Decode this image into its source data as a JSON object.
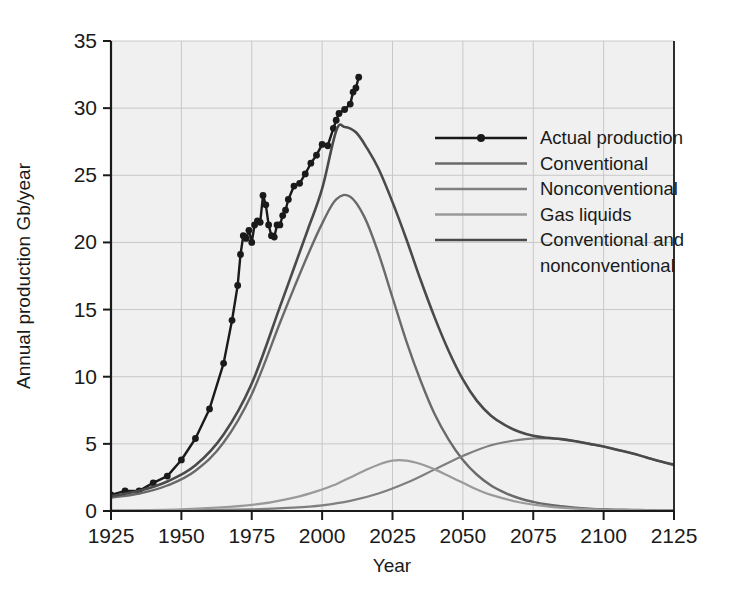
{
  "chart_data": {
    "type": "line",
    "title": "",
    "xlabel": "Year",
    "ylabel": "Annual production Gb/year",
    "xlim": [
      1925,
      2125
    ],
    "ylim": [
      0,
      35
    ],
    "xticks": [
      1925,
      1950,
      1975,
      2000,
      2025,
      2050,
      2075,
      2100,
      2125
    ],
    "yticks": [
      0,
      5,
      10,
      15,
      20,
      25,
      30,
      35
    ],
    "xtick_labels": [
      "1925",
      "1950",
      "1975",
      "2000",
      "2025",
      "2050",
      "2075",
      "2100",
      "2125"
    ],
    "ytick_labels": [
      "0",
      "5",
      "10",
      "15",
      "20",
      "25",
      "30",
      "35"
    ],
    "grid": true,
    "legend_position": "upper right",
    "plot_background": "#f0f0f0",
    "series": [
      {
        "name": "Actual production",
        "color": "#1a1a1a",
        "markers": true,
        "width": 2.4,
        "x": [
          1925,
          1930,
          1935,
          1940,
          1945,
          1950,
          1955,
          1960,
          1965,
          1968,
          1970,
          1971,
          1972,
          1973,
          1974,
          1975,
          1976,
          1977,
          1978,
          1979,
          1980,
          1981,
          1982,
          1983,
          1984,
          1985,
          1986,
          1987,
          1988,
          1990,
          1992,
          1994,
          1996,
          1998,
          2000,
          2002,
          2004,
          2005,
          2006,
          2008,
          2010,
          2011,
          2012,
          2013
        ],
        "y": [
          1.2,
          1.5,
          1.5,
          2.1,
          2.6,
          3.8,
          5.4,
          7.6,
          11.0,
          14.2,
          16.8,
          19.1,
          20.5,
          20.3,
          20.9,
          20.0,
          21.3,
          21.6,
          21.5,
          23.5,
          22.8,
          21.3,
          20.5,
          20.4,
          21.3,
          21.3,
          22.0,
          22.4,
          23.2,
          24.2,
          24.4,
          25.1,
          25.9,
          26.5,
          27.3,
          27.2,
          28.5,
          29.1,
          29.6,
          29.9,
          30.3,
          31.2,
          31.5,
          32.3
        ]
      },
      {
        "name": "Conventional",
        "color": "#6a6a6a",
        "markers": false,
        "width": 2.4,
        "peak_year": 2005,
        "peak_value": 23.5,
        "x": [
          1925,
          1935,
          1945,
          1955,
          1965,
          1975,
          1985,
          1990,
          1995,
          2000,
          2005,
          2010,
          2015,
          2020,
          2025,
          2030,
          2035,
          2040,
          2045,
          2050,
          2055,
          2060,
          2065,
          2070,
          2075,
          2080,
          2085,
          2090,
          2095,
          2100,
          2105,
          2110,
          2115,
          2120,
          2125
        ],
        "y": [
          1.0,
          1.3,
          1.9,
          3.0,
          5.1,
          8.7,
          14.0,
          16.6,
          19.1,
          21.4,
          23.2,
          23.4,
          21.9,
          19.2,
          15.9,
          12.6,
          9.7,
          7.2,
          5.3,
          3.8,
          2.7,
          1.9,
          1.35,
          0.95,
          0.68,
          0.48,
          0.35,
          0.25,
          0.18,
          0.13,
          0.1,
          0.08,
          0.06,
          0.05,
          0.04
        ]
      },
      {
        "name": "Nonconventional",
        "color": "#7f7f7f",
        "markers": false,
        "width": 2.2,
        "peak_year": 2078,
        "peak_value": 5.4,
        "x": [
          1925,
          1950,
          1975,
          1990,
          2000,
          2010,
          2020,
          2030,
          2040,
          2050,
          2060,
          2070,
          2075,
          2080,
          2085,
          2090,
          2095,
          2100,
          2110,
          2120,
          2125
        ],
        "y": [
          0.02,
          0.05,
          0.12,
          0.25,
          0.42,
          0.75,
          1.3,
          2.1,
          3.1,
          4.1,
          4.9,
          5.3,
          5.4,
          5.4,
          5.35,
          5.2,
          5.0,
          4.8,
          4.3,
          3.7,
          3.4
        ]
      },
      {
        "name": "Gas liquids",
        "color": "#9a9a9a",
        "markers": false,
        "width": 2.2,
        "peak_year": 2026,
        "peak_value": 3.8,
        "x": [
          1925,
          1950,
          1975,
          1990,
          2000,
          2005,
          2010,
          2015,
          2020,
          2025,
          2030,
          2035,
          2040,
          2045,
          2050,
          2055,
          2060,
          2070,
          2080,
          2090,
          2100,
          2110,
          2120,
          2125
        ],
        "y": [
          0.05,
          0.12,
          0.45,
          1.0,
          1.6,
          2.0,
          2.5,
          3.0,
          3.45,
          3.75,
          3.75,
          3.5,
          3.1,
          2.6,
          2.1,
          1.6,
          1.2,
          0.65,
          0.35,
          0.18,
          0.1,
          0.06,
          0.04,
          0.03
        ]
      },
      {
        "name": "Conventional and nonconventional",
        "color": "#4a4a4a",
        "markers": false,
        "width": 2.6,
        "peak_year": 2005,
        "peak_value": 28.6,
        "x": [
          1925,
          1935,
          1945,
          1955,
          1965,
          1975,
          1985,
          1990,
          1995,
          2000,
          2005,
          2008,
          2012,
          2016,
          2020,
          2025,
          2030,
          2035,
          2040,
          2045,
          2050,
          2055,
          2060,
          2065,
          2070,
          2075,
          2080,
          2085,
          2090,
          2095,
          2100,
          2105,
          2110,
          2115,
          2120,
          2125
        ],
        "y": [
          1.1,
          1.5,
          2.2,
          3.4,
          5.7,
          9.5,
          15.2,
          18.1,
          21.0,
          24.0,
          28.3,
          28.6,
          28.2,
          27.0,
          25.5,
          23.0,
          20.2,
          17.2,
          14.4,
          11.9,
          9.8,
          8.2,
          7.1,
          6.4,
          5.9,
          5.6,
          5.45,
          5.35,
          5.2,
          5.0,
          4.8,
          4.55,
          4.3,
          4.0,
          3.7,
          3.45
        ]
      }
    ]
  },
  "legend": {
    "entries": [
      {
        "label": "Actual production",
        "color": "#1a1a1a",
        "marker": true
      },
      {
        "label": "Conventional",
        "color": "#6a6a6a",
        "marker": false
      },
      {
        "label": "Nonconventional",
        "color": "#7f7f7f",
        "marker": false
      },
      {
        "label": "Gas liquids",
        "color": "#9a9a9a",
        "marker": false
      },
      {
        "label": "Conventional and",
        "color": "#4a4a4a",
        "marker": false
      },
      {
        "label": "nonconventional",
        "color": "",
        "marker": false
      }
    ]
  },
  "axes": {
    "x_title": "Year",
    "y_title": "Annual production Gb/year",
    "x_labels": [
      "1925",
      "1950",
      "1975",
      "2000",
      "2025",
      "2050",
      "2075",
      "2100",
      "2125"
    ],
    "y_labels": [
      "0",
      "5",
      "10",
      "15",
      "20",
      "25",
      "30",
      "35"
    ]
  },
  "colors": {
    "plot_bg": "#f0f0f0",
    "grid": "#c8c8c8",
    "axis": "#1a1a1a",
    "page_bg": "#ffffff"
  }
}
